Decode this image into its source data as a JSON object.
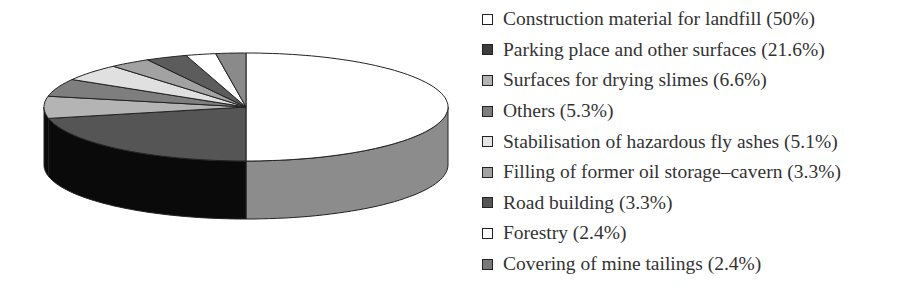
{
  "chart_data": {
    "type": "pie",
    "style": "3d",
    "title": "",
    "legend_position": "right",
    "categories": [
      "Construction material for landfill",
      "Parking place and other surfaces",
      "Surfaces for drying slimes",
      "Others",
      "Stabilisation of hazardous fly ashes",
      "Filling of former oil storage–cavern",
      "Road building",
      "Forestry",
      "Covering of mine tailings"
    ],
    "values": [
      50,
      21.6,
      6.6,
      5.3,
      5.1,
      3.3,
      3.3,
      2.4,
      2.4
    ],
    "unit": "%",
    "colors": [
      "#ffffff",
      "#555555",
      "#b4b4b4",
      "#7e7e7e",
      "#e0e0e0",
      "#a2a2a2",
      "#5c5c5c",
      "#ffffff",
      "#8a8a8a"
    ],
    "side_colors": [
      "#8c8c8c",
      "#0a0a0a"
    ]
  },
  "legend": {
    "items": [
      {
        "label": "Construction material for landfill (50%)",
        "color": "#ffffff"
      },
      {
        "label": "Parking place and other surfaces (21.6%)",
        "color": "#3c3c3c"
      },
      {
        "label": "Surfaces for drying slimes (6.6%)",
        "color": "#b4b4b4"
      },
      {
        "label": "Others (5.3%)",
        "color": "#7e7e7e"
      },
      {
        "label": "Stabilisation of hazardous fly ashes (5.1%)",
        "color": "#e6e6e6"
      },
      {
        "label": "Filling of former oil storage–cavern (3.3%)",
        "color": "#a2a2a2"
      },
      {
        "label": "Road building (3.3%)",
        "color": "#555555"
      },
      {
        "label": "Forestry (2.4%)",
        "color": "#ffffff"
      },
      {
        "label": "Covering of mine tailings (2.4%)",
        "color": "#7a7a7a"
      }
    ]
  }
}
